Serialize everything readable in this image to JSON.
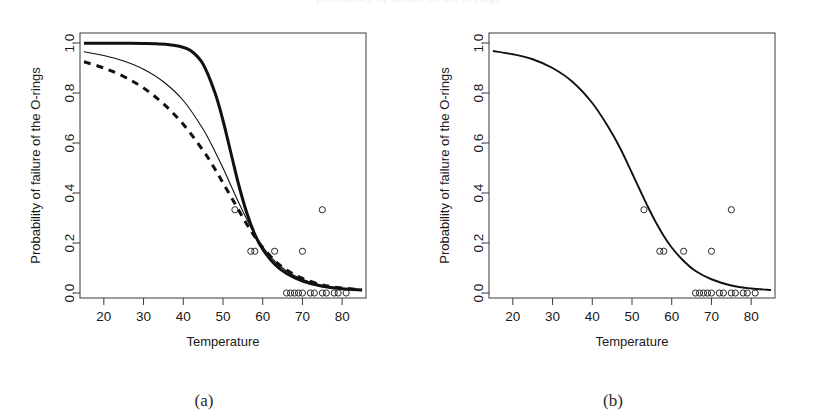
{
  "figure": {
    "top_cut_text": "probability of failure of the O-rings",
    "panels": [
      {
        "id": "a",
        "caption": "(a)",
        "xlabel": "Temperature",
        "ylabel": "Probability of failure of the O-rings",
        "xticks": [
          "20",
          "30",
          "40",
          "50",
          "60",
          "70",
          "80"
        ],
        "yticks": [
          "0.0",
          "0.2",
          "0.4",
          "0.6",
          "0.8",
          "1.0"
        ]
      },
      {
        "id": "b",
        "caption": "(b)",
        "xlabel": "Temperature",
        "ylabel": "Probability of failure of the O-rings",
        "xticks": [
          "20",
          "30",
          "40",
          "50",
          "60",
          "70",
          "80"
        ],
        "yticks": [
          "0.0",
          "0.2",
          "0.4",
          "0.6",
          "0.8",
          "1.0"
        ]
      }
    ]
  },
  "chart_data": [
    {
      "type": "line",
      "panel": "a",
      "title": "",
      "xlabel": "Temperature",
      "ylabel": "Probability of failure of the O-rings",
      "xlim": [
        14,
        86
      ],
      "ylim": [
        -0.02,
        1.04
      ],
      "xticks": [
        20,
        30,
        40,
        50,
        60,
        70,
        80
      ],
      "yticks": [
        0.0,
        0.2,
        0.4,
        0.6,
        0.8,
        1.0
      ],
      "grid": false,
      "legend": "none",
      "series": [
        {
          "name": "fitted curve (thick solid)",
          "style": "solid-thick",
          "x": [
            15,
            20,
            25,
            30,
            33,
            36,
            39,
            42,
            45,
            48,
            50,
            52,
            54,
            56,
            58,
            60,
            63,
            66,
            70,
            75,
            80,
            85
          ],
          "y": [
            0.999,
            0.999,
            0.999,
            0.998,
            0.997,
            0.994,
            0.987,
            0.968,
            0.915,
            0.8,
            0.69,
            0.56,
            0.43,
            0.32,
            0.235,
            0.175,
            0.115,
            0.078,
            0.048,
            0.027,
            0.017,
            0.012
          ]
        },
        {
          "name": "alternative fit (thin solid)",
          "style": "solid-thin",
          "x": [
            15,
            20,
            25,
            30,
            35,
            40,
            45,
            48,
            50,
            52,
            54,
            56,
            58,
            60,
            63,
            66,
            70,
            75,
            80,
            85
          ],
          "y": [
            0.965,
            0.95,
            0.928,
            0.895,
            0.845,
            0.77,
            0.655,
            0.565,
            0.5,
            0.43,
            0.36,
            0.295,
            0.235,
            0.185,
            0.128,
            0.088,
            0.055,
            0.03,
            0.018,
            0.012
          ]
        },
        {
          "name": "alternative fit (dashed)",
          "style": "dashed",
          "x": [
            15,
            20,
            25,
            30,
            35,
            40,
            45,
            48,
            50,
            52,
            54,
            56,
            58,
            60,
            63,
            66,
            70,
            75,
            80,
            85
          ],
          "y": [
            0.925,
            0.9,
            0.866,
            0.82,
            0.757,
            0.675,
            0.57,
            0.495,
            0.44,
            0.385,
            0.33,
            0.275,
            0.225,
            0.182,
            0.13,
            0.092,
            0.058,
            0.032,
            0.02,
            0.013
          ]
        }
      ],
      "scatter": {
        "name": "observed O-ring failure proportion",
        "marker": "open-circle",
        "points": [
          [
            53,
            0.333
          ],
          [
            57,
            0.167
          ],
          [
            58,
            0.167
          ],
          [
            63,
            0.167
          ],
          [
            70,
            0.167
          ],
          [
            75,
            0.333
          ],
          [
            66,
            0.0
          ],
          [
            67,
            0.0
          ],
          [
            68,
            0.0
          ],
          [
            69,
            0.0
          ],
          [
            70,
            0.0
          ],
          [
            72,
            0.0
          ],
          [
            73,
            0.0
          ],
          [
            75,
            0.0
          ],
          [
            76,
            0.0
          ],
          [
            78,
            0.0
          ],
          [
            79,
            0.0
          ],
          [
            81,
            0.0
          ]
        ]
      }
    },
    {
      "type": "line",
      "panel": "b",
      "title": "",
      "xlabel": "Temperature",
      "ylabel": "Probability of failure of the O-rings",
      "xlim": [
        14,
        86
      ],
      "ylim": [
        -0.02,
        1.04
      ],
      "xticks": [
        20,
        30,
        40,
        50,
        60,
        70,
        80
      ],
      "yticks": [
        0.0,
        0.2,
        0.4,
        0.6,
        0.8,
        1.0
      ],
      "grid": false,
      "legend": "none",
      "series": [
        {
          "name": "fitted logistic curve",
          "style": "solid-medium",
          "x": [
            15,
            20,
            25,
            30,
            35,
            40,
            44,
            47,
            50,
            52,
            54,
            56,
            58,
            60,
            63,
            66,
            70,
            75,
            80,
            85
          ],
          "y": [
            0.968,
            0.955,
            0.935,
            0.9,
            0.845,
            0.76,
            0.665,
            0.58,
            0.48,
            0.412,
            0.345,
            0.283,
            0.228,
            0.182,
            0.128,
            0.088,
            0.055,
            0.03,
            0.018,
            0.012
          ]
        }
      ],
      "scatter": {
        "name": "observed O-ring failure proportion",
        "marker": "open-circle",
        "points": [
          [
            53,
            0.333
          ],
          [
            57,
            0.167
          ],
          [
            58,
            0.167
          ],
          [
            63,
            0.167
          ],
          [
            70,
            0.167
          ],
          [
            75,
            0.333
          ],
          [
            66,
            0.0
          ],
          [
            67,
            0.0
          ],
          [
            68,
            0.0
          ],
          [
            69,
            0.0
          ],
          [
            70,
            0.0
          ],
          [
            72,
            0.0
          ],
          [
            73,
            0.0
          ],
          [
            75,
            0.0
          ],
          [
            76,
            0.0
          ],
          [
            78,
            0.0
          ],
          [
            79,
            0.0
          ],
          [
            81,
            0.0
          ]
        ]
      }
    }
  ]
}
